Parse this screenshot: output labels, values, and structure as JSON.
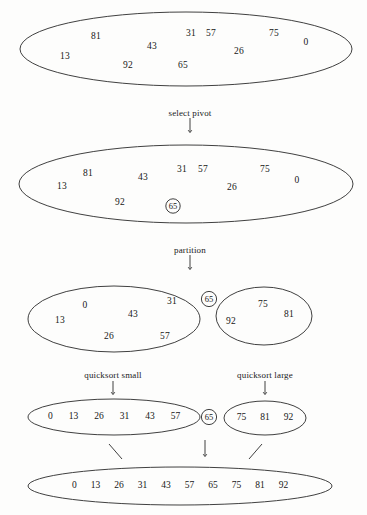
{
  "figure": {
    "stroke_color": "#2a2a2a",
    "text_color": "#161616",
    "background_color": "#fdfdfc"
  },
  "steps": [
    {
      "label": "select pivot"
    },
    {
      "label": "partition"
    },
    {
      "label": "quicksort small"
    },
    {
      "label": "quicksort large"
    }
  ],
  "stage1": {
    "name": "unsorted-list",
    "items": [
      {
        "value": "13",
        "x": 65,
        "y": 57
      },
      {
        "value": "81",
        "x": 96,
        "y": 37
      },
      {
        "value": "92",
        "x": 128,
        "y": 66
      },
      {
        "value": "43",
        "x": 152,
        "y": 47
      },
      {
        "value": "65",
        "x": 183,
        "y": 66
      },
      {
        "value": "31",
        "x": 191,
        "y": 34
      },
      {
        "value": "57",
        "x": 211,
        "y": 34
      },
      {
        "value": "26",
        "x": 239,
        "y": 52
      },
      {
        "value": "75",
        "x": 274,
        "y": 34
      },
      {
        "value": "0",
        "x": 306,
        "y": 43
      }
    ]
  },
  "stage2": {
    "name": "list-with-pivot-selected",
    "items": [
      {
        "value": "13",
        "x": 62,
        "y": 187
      },
      {
        "value": "81",
        "x": 88,
        "y": 174
      },
      {
        "value": "92",
        "x": 120,
        "y": 203
      },
      {
        "value": "43",
        "x": 143,
        "y": 178
      },
      {
        "value": "31",
        "x": 182,
        "y": 170
      },
      {
        "value": "57",
        "x": 203,
        "y": 170
      },
      {
        "value": "26",
        "x": 232,
        "y": 188
      },
      {
        "value": "75",
        "x": 265,
        "y": 170
      },
      {
        "value": "0",
        "x": 297,
        "y": 181
      }
    ],
    "pivot": {
      "value": "65",
      "x": 173,
      "y": 206
    }
  },
  "stage3": {
    "small": {
      "name": "small-partition",
      "items": [
        {
          "value": "13",
          "x": 60,
          "y": 321
        },
        {
          "value": "0",
          "x": 85,
          "y": 306
        },
        {
          "value": "26",
          "x": 109,
          "y": 337
        },
        {
          "value": "43",
          "x": 133,
          "y": 315
        },
        {
          "value": "31",
          "x": 172,
          "y": 302
        },
        {
          "value": "57",
          "x": 165,
          "y": 337
        }
      ]
    },
    "pivot": {
      "value": "65",
      "x": 209,
      "y": 299
    },
    "large": {
      "name": "large-partition",
      "items": [
        {
          "value": "92",
          "x": 231,
          "y": 322
        },
        {
          "value": "75",
          "x": 263,
          "y": 305
        },
        {
          "value": "81",
          "x": 289,
          "y": 315
        }
      ]
    }
  },
  "stage4": {
    "small_sorted": {
      "name": "small-sorted-list",
      "values": [
        "0",
        "13",
        "26",
        "31",
        "43",
        "57"
      ]
    },
    "pivot": {
      "value": "65",
      "x": 209,
      "y": 417
    },
    "large_sorted": {
      "name": "large-sorted-list",
      "values": [
        "75",
        "81",
        "92"
      ]
    }
  },
  "stage5": {
    "name": "final-sorted-list",
    "values": [
      "0",
      "13",
      "26",
      "31",
      "43",
      "57",
      "65",
      "75",
      "81",
      "92"
    ]
  }
}
